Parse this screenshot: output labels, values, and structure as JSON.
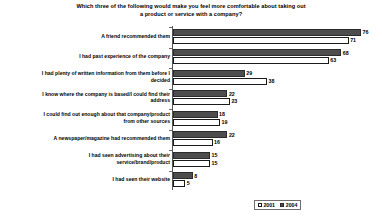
{
  "chart_data": {
    "type": "bar",
    "orientation": "horizontal",
    "title": "Which three of the following would make you feel more comfortable about taking out a product or service with a company?",
    "title_lines": [
      "Which three of the following would make you feel more comfortable about taking out",
      "a product or service with a company?"
    ],
    "xlabel": "",
    "ylabel": "",
    "xlim": [
      0,
      80
    ],
    "grid": false,
    "legend_position": "bottom-right",
    "categories": [
      "A friend recommended them",
      "I had past experience of the company",
      "I had plenty of written information from them before I decided",
      "I know where the company is based/I could find their address",
      "I could find out enough about that company/product from other sources",
      "A newspaper/magazine had recommended them",
      "I had seen advertising about their service/brand/product",
      "I had seen their website"
    ],
    "category_lines": [
      [
        "A friend recommended them"
      ],
      [
        "I had past experience of the company"
      ],
      [
        "I had plenty of written information from them before I",
        "decided"
      ],
      [
        "I know where the company is based/I could find their",
        "address"
      ],
      [
        "I could find out enough about that company/product",
        "from other sources"
      ],
      [
        "A newspaper/magazine had recommended them"
      ],
      [
        "I had seen advertising about their",
        "service/brand/product"
      ],
      [
        "I had seen their website"
      ]
    ],
    "series": [
      {
        "name": "2004",
        "color": "#4d4d4d",
        "values": [
          76,
          68,
          29,
          22,
          18,
          22,
          15,
          8
        ]
      },
      {
        "name": "2001",
        "color": "#ffffff",
        "values": [
          71,
          63,
          38,
          23,
          19,
          16,
          15,
          5
        ]
      }
    ]
  },
  "legend": {
    "items": [
      {
        "label": "2001",
        "swatch": "white-square-icon"
      },
      {
        "label": "2004",
        "swatch": "dark-square-icon"
      }
    ]
  }
}
